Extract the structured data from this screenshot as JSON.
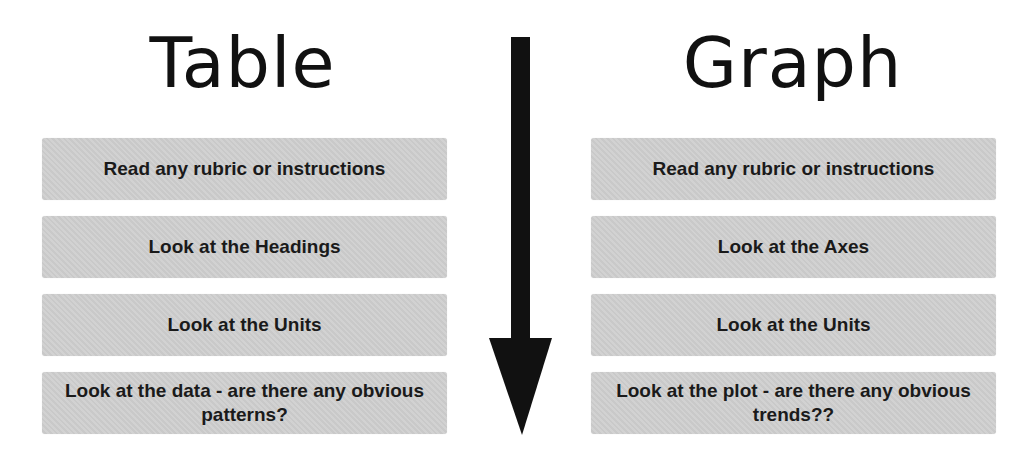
{
  "left_column": {
    "title": "Table",
    "steps": [
      "Read any rubric or instructions",
      "Look at the Headings",
      "Look at the Units",
      "Look at the data - are there any obvious patterns?"
    ]
  },
  "right_column": {
    "title": "Graph",
    "steps": [
      "Read any rubric or instructions",
      "Look at the Axes",
      "Look at the Units",
      "Look at the plot - are there any obvious trends??"
    ]
  },
  "arrow": {
    "direction": "down",
    "icon": "arrow-down-icon",
    "color": "#111111"
  },
  "colors": {
    "box_fill": "#cfcfcf",
    "text": "#1a1a1a",
    "background": "#ffffff"
  }
}
